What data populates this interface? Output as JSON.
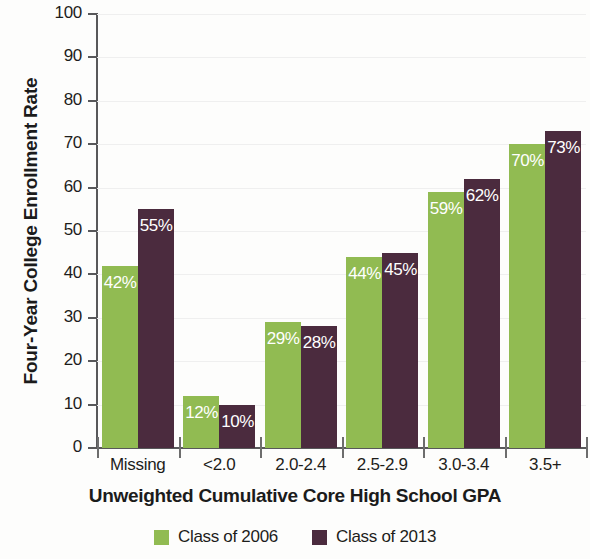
{
  "chart_data": {
    "type": "bar",
    "title": "",
    "xlabel": "Unweighted Cumulative Core High School GPA",
    "ylabel": "Four-Year College Enrollment Rate",
    "categories": [
      "Missing",
      "<2.0",
      "2.0-2.4",
      "2.5-2.9",
      "3.0-3.4",
      "3.5+"
    ],
    "series": [
      {
        "name": "Class of 2006",
        "color": "#91bb52",
        "values": [
          42,
          12,
          29,
          44,
          59,
          70
        ],
        "labels": [
          "42%",
          "12%",
          "29%",
          "44%",
          "59%",
          "70%"
        ]
      },
      {
        "name": "Class of 2013",
        "color": "#4b2b3e",
        "values": [
          55,
          10,
          28,
          45,
          62,
          73
        ],
        "labels": [
          "55%",
          "10%",
          "28%",
          "45%",
          "62%",
          "73%"
        ]
      }
    ],
    "ylim": [
      0,
      100
    ],
    "y_ticks": [
      0,
      10,
      20,
      30,
      40,
      50,
      60,
      70,
      80,
      90,
      100
    ],
    "y_tick_labels": [
      "0",
      "10",
      "20",
      "30",
      "40",
      "50",
      "60",
      "70",
      "80",
      "90",
      "100"
    ],
    "grid": true,
    "legend_position": "bottom",
    "background_color": "#fdfdfc",
    "axis_color": "#58585a"
  },
  "legend": {
    "entries": [
      {
        "label": "Class of 2006",
        "color": "#91bb52"
      },
      {
        "label": "Class of 2013",
        "color": "#4b2b3e"
      }
    ]
  }
}
